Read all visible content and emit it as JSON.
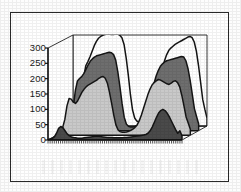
{
  "figure": {
    "title": "",
    "frame": {
      "border_color": "#2a2a2a",
      "background": "#ffffff"
    }
  },
  "chart_data": {
    "type": "area",
    "title": "",
    "subtitle": "",
    "xlabel": "",
    "ylabel": "",
    "ylim": [
      0,
      300
    ],
    "yticks": [
      300,
      250,
      200,
      150,
      100,
      50,
      0
    ],
    "ytick_labels": [
      "300",
      "250",
      "200",
      "150",
      "100",
      "50",
      "0"
    ],
    "grid": false,
    "legend": "none",
    "legend_entries": [],
    "projection": "3d-stacked-ribbons",
    "x_axis_ticks_visible": true,
    "x_tick_count": 64,
    "x_tick_labels": [],
    "series": [
      {
        "name": "series-1-front",
        "color": "#4a4a4a",
        "depth_index": 0,
        "values": [
          2,
          3,
          5,
          10,
          22,
          38,
          44,
          40,
          30,
          20,
          14,
          10,
          8,
          7,
          6,
          6,
          6,
          7,
          8,
          9,
          10,
          11,
          12,
          12,
          12,
          11,
          10,
          9,
          8,
          8,
          8,
          7,
          7,
          7,
          7,
          7,
          8,
          8,
          9,
          10,
          11,
          12,
          13,
          14,
          15,
          16,
          18,
          22,
          30,
          42,
          58,
          74,
          88,
          96,
          100,
          96,
          88,
          76,
          62,
          48,
          34,
          22,
          30,
          14
        ]
      },
      {
        "name": "series-2",
        "color": "#c9c9c9",
        "depth_index": 1,
        "values": [
          4,
          6,
          10,
          26,
          52,
          96,
          120,
          118,
          108,
          104,
          112,
          126,
          140,
          150,
          158,
          164,
          168,
          172,
          176,
          180,
          186,
          190,
          192,
          186,
          170,
          140,
          104,
          66,
          34,
          18,
          12,
          10,
          10,
          11,
          13,
          16,
          20,
          26,
          34,
          48,
          66,
          88,
          110,
          132,
          150,
          164,
          172,
          178,
          182,
          180,
          176,
          172,
          168,
          166,
          170,
          176,
          178,
          172,
          158,
          130,
          96,
          60,
          40,
          20
        ]
      },
      {
        "name": "series-3",
        "color": "#6e6e6e",
        "depth_index": 2,
        "values": [
          5,
          8,
          14,
          34,
          72,
          130,
          162,
          170,
          176,
          186,
          200,
          214,
          226,
          234,
          240,
          244,
          246,
          248,
          250,
          252,
          254,
          256,
          254,
          248,
          230,
          192,
          142,
          88,
          44,
          22,
          14,
          12,
          12,
          14,
          17,
          22,
          28,
          38,
          52,
          74,
          100,
          128,
          154,
          178,
          196,
          210,
          218,
          224,
          228,
          230,
          232,
          234,
          236,
          238,
          240,
          242,
          240,
          228,
          202,
          164,
          118,
          72,
          46,
          22
        ]
      },
      {
        "name": "series-4",
        "color": "#ffffff",
        "depth_index": 3,
        "values": [
          6,
          10,
          18,
          42,
          88,
          158,
          196,
          210,
          226,
          244,
          262,
          276,
          286,
          292,
          296,
          298,
          300,
          300,
          298,
          298,
          300,
          300,
          296,
          288,
          266,
          222,
          166,
          102,
          52,
          26,
          16,
          14,
          14,
          16,
          20,
          26,
          34,
          46,
          64,
          90,
          122,
          156,
          186,
          212,
          232,
          246,
          254,
          260,
          266,
          270,
          274,
          278,
          282,
          286,
          290,
          292,
          288,
          274,
          244,
          198,
          142,
          86,
          54,
          26
        ]
      }
    ]
  }
}
